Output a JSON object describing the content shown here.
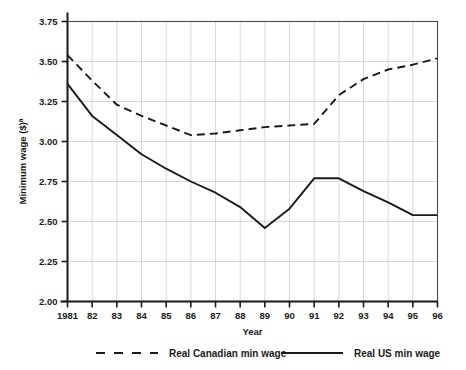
{
  "chart_data": {
    "type": "line",
    "title": "",
    "subtitle": "",
    "xlabel": "Year",
    "ylabel": "Minimum wage ($)",
    "ylabel_superscript": "a",
    "x": [
      1981,
      1982,
      1983,
      1984,
      1985,
      1986,
      1987,
      1988,
      1989,
      1990,
      1991,
      1992,
      1993,
      1994,
      1995,
      1996
    ],
    "categories": [
      "1981",
      "82",
      "83",
      "84",
      "85",
      "86",
      "87",
      "88",
      "89",
      "90",
      "91",
      "92",
      "93",
      "94",
      "95",
      "96"
    ],
    "xlim": [
      1981,
      1996
    ],
    "ylim": [
      2.0,
      3.75
    ],
    "yticks": [
      "2.00",
      "2.25",
      "2.50",
      "2.75",
      "3.00",
      "3.25",
      "3.50",
      "3.75"
    ],
    "ytick_values": [
      2.0,
      2.25,
      2.5,
      2.75,
      3.0,
      3.25,
      3.5,
      3.75
    ],
    "grid": true,
    "legend_position": "bottom",
    "series": [
      {
        "name": "Real Canadian min wage",
        "style": "dashed",
        "color": "#1a1a1a",
        "values": [
          3.54,
          3.38,
          3.23,
          3.16,
          3.1,
          3.04,
          3.05,
          3.07,
          3.09,
          3.1,
          3.11,
          3.29,
          3.39,
          3.45,
          3.48,
          3.52
        ]
      },
      {
        "name": "Real US min wage",
        "style": "solid",
        "color": "#1a1a1a",
        "values": [
          3.36,
          3.16,
          3.04,
          2.92,
          2.83,
          2.75,
          2.68,
          2.59,
          2.46,
          2.58,
          2.77,
          2.77,
          2.69,
          2.62,
          2.54,
          2.54
        ]
      }
    ],
    "annotations": []
  },
  "legend": {
    "items": [
      {
        "label": "Real Canadian min wage",
        "style": "dashed"
      },
      {
        "label": "Real US min wage",
        "style": "solid"
      }
    ]
  }
}
